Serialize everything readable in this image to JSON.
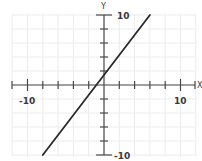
{
  "chart_data": {
    "type": "line",
    "title": "",
    "xlabel": "X",
    "ylabel": "Y",
    "xlim": [
      -12,
      12
    ],
    "ylim": [
      -10,
      10
    ],
    "grid": true,
    "grid_step": 2,
    "tick_step": 2,
    "tick_labels": {
      "x": [
        {
          "value": -10,
          "label": "-10"
        },
        {
          "value": 10,
          "label": "10"
        }
      ],
      "y": [
        {
          "value": 10,
          "label": "10"
        },
        {
          "value": -10,
          "label": "-10"
        }
      ]
    },
    "series": [
      {
        "name": "line",
        "color": "#2a2a2a",
        "points": [
          {
            "x": -8,
            "y": -10
          },
          {
            "x": 6,
            "y": 10
          }
        ],
        "approx_equation": "y = (10/7)(x + 1)",
        "x_intercept": -1,
        "y_intercept": 1.43
      }
    ]
  },
  "labels": {
    "x_axis_name": "X",
    "y_axis_name": "Y",
    "x_min_label": "-10",
    "x_max_label": "10",
    "y_max_label": "10",
    "y_min_label": "-10"
  }
}
